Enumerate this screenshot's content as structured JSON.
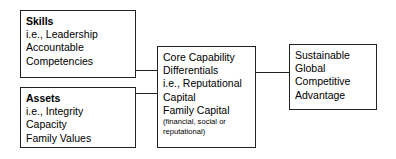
{
  "diagram": {
    "stroke_color": "#222222",
    "background_color": "#ffffff",
    "text_color": "#000000",
    "boxes": [
      {
        "id": "skills",
        "heading": "Skills",
        "lines": [
          "i.e., Leadership",
          "Accountable",
          "Competencies"
        ]
      },
      {
        "id": "assets",
        "heading": "Assets",
        "lines": [
          "i.e., Integrity",
          "Capacity",
          "Family Values"
        ]
      },
      {
        "id": "core",
        "lines": [
          "Core Capability",
          "Differentials",
          "i.e., Reputational",
          "Capital",
          "Family Capital"
        ],
        "small_lines": [
          "(financial, social or",
          "reputational)"
        ]
      },
      {
        "id": "outcome",
        "lines": [
          "Sustainable",
          "Global",
          "Competitive",
          "Advantage"
        ]
      }
    ],
    "connectors": [
      {
        "id": "skills-to-core",
        "from": "skills",
        "to": "core"
      },
      {
        "id": "assets-to-core",
        "from": "assets",
        "to": "core"
      },
      {
        "id": "core-to-outcome",
        "from": "core",
        "to": "outcome"
      }
    ]
  }
}
